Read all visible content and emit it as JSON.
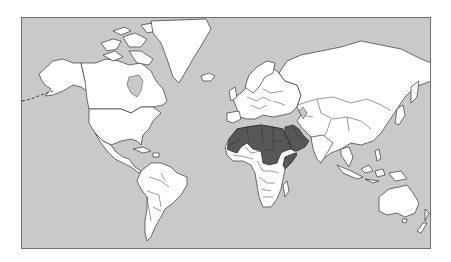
{
  "map": {
    "projection": "Mercator world map",
    "colors": {
      "ocean": "#c9c9c9",
      "land": "#ffffff",
      "highlighted": "#575757",
      "frame": "#6e6e6e"
    },
    "highlighted_region": "Arab League countries (North Africa & Middle East)",
    "highlighted_countries": [
      "Morocco",
      "Western Sahara",
      "Mauritania",
      "Algeria",
      "Tunisia",
      "Libya",
      "Egypt",
      "Sudan",
      "Djibouti",
      "Somalia",
      "Saudi Arabia",
      "Yemen",
      "Oman",
      "United Arab Emirates",
      "Qatar",
      "Kuwait",
      "Iraq",
      "Syria",
      "Jordan",
      "Lebanon"
    ],
    "continents": [
      "North America",
      "South America",
      "Europe",
      "Africa",
      "Asia",
      "Australia",
      "Greenland"
    ]
  }
}
